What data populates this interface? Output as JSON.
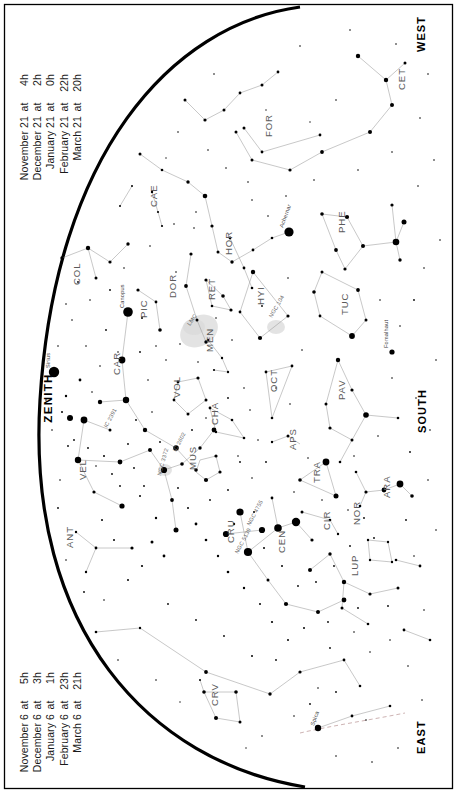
{
  "date_blocks": {
    "upper": {
      "name": "upper-date-list",
      "lines": [
        {
          "date": "November 21",
          "at": "at",
          "time": "4h"
        },
        {
          "date": "December 21",
          "at": "at",
          "time": "2h"
        },
        {
          "date": "January 21",
          "at": "at",
          "time": "0h"
        },
        {
          "date": "February 21",
          "at": "at",
          "time": "22h"
        },
        {
          "date": "March 21",
          "at": "at",
          "time": "20h"
        }
      ]
    },
    "lower": {
      "name": "lower-date-list",
      "lines": [
        {
          "date": "November 6",
          "at": "at",
          "time": "5h"
        },
        {
          "date": "December 6",
          "at": "at",
          "time": "3h"
        },
        {
          "date": "January 6",
          "at": "at",
          "time": "1h"
        },
        {
          "date": "February 6",
          "at": "at",
          "time": "23h"
        },
        {
          "date": "March 6",
          "at": "at",
          "time": "21h"
        }
      ]
    }
  },
  "cardinals": {
    "west": "WEST",
    "south": "SOUTH",
    "east": "EAST",
    "zenith": "ZENITH"
  },
  "chart_data": {
    "type": "scatter",
    "projection": "horizon-arc planisphere",
    "xlabel": "",
    "ylabel": "",
    "grid": false,
    "legend": "none",
    "constellations": [
      {
        "abbr": "CET",
        "x": 405,
        "y": 90
      },
      {
        "abbr": "FOR",
        "x": 272,
        "y": 137
      },
      {
        "abbr": "PHE",
        "x": 345,
        "y": 233
      },
      {
        "abbr": "CAE",
        "x": 157,
        "y": 207
      },
      {
        "abbr": "HOR",
        "x": 232,
        "y": 255
      },
      {
        "abbr": "RET",
        "x": 215,
        "y": 300
      },
      {
        "abbr": "COL",
        "x": 80,
        "y": 285
      },
      {
        "abbr": "PIC",
        "x": 147,
        "y": 318
      },
      {
        "abbr": "DOR",
        "x": 176,
        "y": 298
      },
      {
        "abbr": "MEN",
        "x": 213,
        "y": 352
      },
      {
        "abbr": "HYI",
        "x": 264,
        "y": 305
      },
      {
        "abbr": "TUC",
        "x": 348,
        "y": 315
      },
      {
        "abbr": "CAR",
        "x": 120,
        "y": 375
      },
      {
        "abbr": "VOL",
        "x": 180,
        "y": 398
      },
      {
        "abbr": "CHA",
        "x": 218,
        "y": 425
      },
      {
        "abbr": "OCT",
        "x": 277,
        "y": 392
      },
      {
        "abbr": "PAV",
        "x": 345,
        "y": 400
      },
      {
        "abbr": "VEL",
        "x": 86,
        "y": 480
      },
      {
        "abbr": "MUS",
        "x": 196,
        "y": 470
      },
      {
        "abbr": "APS",
        "x": 296,
        "y": 450
      },
      {
        "abbr": "TRA",
        "x": 320,
        "y": 483
      },
      {
        "abbr": "ARA",
        "x": 390,
        "y": 498
      },
      {
        "abbr": "CRU",
        "x": 234,
        "y": 543
      },
      {
        "abbr": "CEN",
        "x": 285,
        "y": 553
      },
      {
        "abbr": "CIR",
        "x": 330,
        "y": 530
      },
      {
        "abbr": "NOR",
        "x": 360,
        "y": 525
      },
      {
        "abbr": "ANT",
        "x": 73,
        "y": 548
      },
      {
        "abbr": "LUP",
        "x": 358,
        "y": 576
      },
      {
        "abbr": "CRV",
        "x": 218,
        "y": 706
      }
    ],
    "named_stars": [
      {
        "name": "Achernar",
        "x": 289,
        "y": 232,
        "magnitude": 0.5
      },
      {
        "name": "Canopus",
        "x": 128,
        "y": 312,
        "magnitude": -0.7
      },
      {
        "name": "Sirius",
        "x": 54,
        "y": 372,
        "magnitude": -1.5
      },
      {
        "name": "Fomalhaut",
        "x": 392,
        "y": 352,
        "magnitude": 1.2
      },
      {
        "name": "Spica",
        "x": 318,
        "y": 728,
        "magnitude": 1.0
      }
    ],
    "deep_sky_objects": [
      {
        "name": "LMC",
        "x": 196,
        "y": 330,
        "type": "galaxy"
      },
      {
        "name": "NGC 104",
        "x": 272,
        "y": 322,
        "type": "globular-cluster"
      },
      {
        "name": "IC 2391",
        "x": 109,
        "y": 430,
        "type": "open-cluster"
      },
      {
        "name": "IC 2602",
        "x": 174,
        "y": 455,
        "type": "open-cluster"
      },
      {
        "name": "NGC 3372",
        "x": 162,
        "y": 478,
        "type": "nebula"
      },
      {
        "name": "NGC 4755",
        "x": 252,
        "y": 528,
        "type": "open-cluster"
      },
      {
        "name": "NGC 5139",
        "x": 240,
        "y": 556,
        "type": "globular-cluster"
      }
    ],
    "star_count_plotted": 330,
    "magnitude_limit": 5.0
  }
}
